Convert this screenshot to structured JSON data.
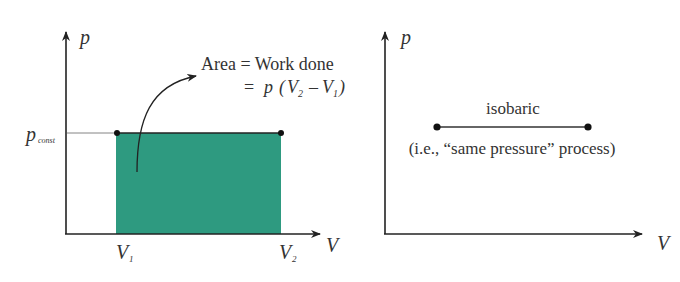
{
  "left_diagram": {
    "y_axis_label": "p",
    "x_axis_label": "V",
    "p_const_main": "p",
    "p_const_sub": "const",
    "v1_main": "V",
    "v1_sub": "1",
    "v2_main": "V",
    "v2_sub": "2",
    "annotation_line1": "Area = Work done",
    "annotation_eq": "=",
    "annotation_p": "p",
    "annotation_open": "(",
    "annotation_v2": "V",
    "annotation_v2_sub": "2",
    "annotation_minus": "–",
    "annotation_v1": "V",
    "annotation_v1_sub": "1",
    "annotation_close": ")",
    "fill_color": "#2e9a80"
  },
  "right_diagram": {
    "y_axis_label": "p",
    "x_axis_label": "V",
    "process_label": "isobaric",
    "process_note": "(i.e., “same pressure” process)"
  }
}
